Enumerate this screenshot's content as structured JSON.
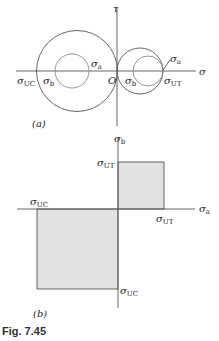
{
  "figure": {
    "caption": "Fig. 7.45",
    "colors": {
      "line": "#555555",
      "fill": "#e2e2e2",
      "text": "#222222"
    },
    "panel_a": {
      "label": "(a)",
      "axes": {
        "horizontal": "σ",
        "vertical": "τ",
        "origin": "O"
      },
      "circles": [
        {
          "name": "left-outer",
          "cx": 77,
          "cy": 71,
          "r": 41
        },
        {
          "name": "left-inner",
          "cx": 72,
          "cy": 71,
          "r": 17
        },
        {
          "name": "right-outer",
          "cx": 140,
          "cy": 71,
          "r": 23
        },
        {
          "name": "right-inner",
          "cx": 148,
          "cy": 71,
          "r": 15
        }
      ],
      "labels": {
        "sigma_uc": "σ",
        "sigma_uc_sub": "UC",
        "sigma_b_left": "σ",
        "sigma_b_left_sub": "b",
        "sigma_a_left": "σ",
        "sigma_a_left_sub": "a",
        "sigma_b_right": "σ",
        "sigma_b_right_sub": "b",
        "sigma_ut": "σ",
        "sigma_ut_sub": "UT",
        "sigma_a_right": "σ",
        "sigma_a_right_sub": "a"
      }
    },
    "panel_b": {
      "label": "(b)",
      "axes": {
        "horizontal": "σ",
        "horizontal_sub": "a",
        "vertical": "σ",
        "vertical_sub": "b"
      },
      "regions": [
        {
          "name": "tension-square",
          "x1": 0,
          "y1": 0,
          "x2": "σUT",
          "y2": "σUT"
        },
        {
          "name": "compression-square",
          "x1": "σUC",
          "y1": "σUC",
          "x2": 0,
          "y2": 0
        }
      ],
      "labels": {
        "ut_vertical": "σ",
        "ut_vertical_sub": "UT",
        "ut_horizontal": "σ",
        "ut_horizontal_sub": "UT",
        "uc_horizontal": "σ",
        "uc_horizontal_sub": "UC",
        "uc_vertical": "σ",
        "uc_vertical_sub": "UC"
      }
    }
  }
}
